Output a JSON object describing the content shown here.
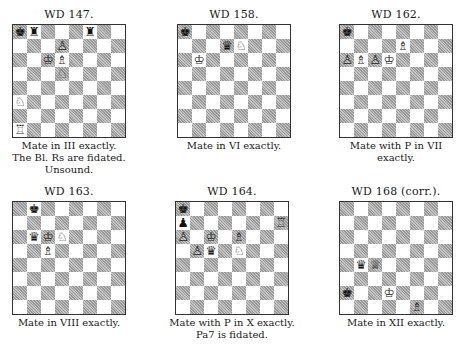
{
  "problems": [
    {
      "id": "wd147",
      "title": "WD 147.",
      "caption": [
        "Mate in III exactly.",
        "The Bl. Rs are fidated.",
        "Unsound."
      ],
      "pieces": [
        {
          "sq": "a8",
          "color": "black",
          "type": "king",
          "glyph": "♚"
        },
        {
          "sq": "b8",
          "color": "black",
          "type": "rook",
          "glyph": "♜"
        },
        {
          "sq": "f8",
          "color": "black",
          "type": "rook",
          "glyph": "♜"
        },
        {
          "sq": "d7",
          "color": "white",
          "type": "pawn",
          "glyph": "♙"
        },
        {
          "sq": "c6",
          "color": "white",
          "type": "king",
          "glyph": "♔"
        },
        {
          "sq": "d6",
          "color": "white",
          "type": "bishop",
          "glyph": "♗"
        },
        {
          "sq": "d5",
          "color": "white",
          "type": "knight",
          "glyph": "♘"
        },
        {
          "sq": "a3",
          "color": "white",
          "type": "knight",
          "glyph": "♘"
        },
        {
          "sq": "a1",
          "color": "white",
          "type": "rook",
          "glyph": "♖"
        }
      ]
    },
    {
      "id": "wd158",
      "title": "WD 158.",
      "caption": [
        "Mate in VI exactly."
      ],
      "pieces": [
        {
          "sq": "a8",
          "color": "black",
          "type": "king",
          "glyph": "♚"
        },
        {
          "sq": "d7",
          "color": "black",
          "type": "queen",
          "glyph": "♛"
        },
        {
          "sq": "e7",
          "color": "white",
          "type": "knight",
          "glyph": "♘"
        },
        {
          "sq": "b6",
          "color": "white",
          "type": "king",
          "glyph": "♔"
        }
      ]
    },
    {
      "id": "wd162",
      "title": "WD 162.",
      "caption": [
        "Mate with P in VII",
        "exactly."
      ],
      "pieces": [
        {
          "sq": "a8",
          "color": "black",
          "type": "king",
          "glyph": "♚"
        },
        {
          "sq": "e7",
          "color": "white",
          "type": "bishop",
          "glyph": "♗"
        },
        {
          "sq": "a6",
          "color": "white",
          "type": "pawn",
          "glyph": "♙"
        },
        {
          "sq": "b6",
          "color": "white",
          "type": "bishop",
          "glyph": "♗"
        },
        {
          "sq": "c6",
          "color": "white",
          "type": "pawn",
          "glyph": "♙"
        },
        {
          "sq": "d6",
          "color": "white",
          "type": "king",
          "glyph": "♔"
        }
      ]
    },
    {
      "id": "wd163",
      "title": "WD 163.",
      "caption": [
        "Mate in VIII exactly."
      ],
      "pieces": [
        {
          "sq": "b8",
          "color": "black",
          "type": "king",
          "glyph": "♚"
        },
        {
          "sq": "b6",
          "color": "black",
          "type": "queen",
          "glyph": "♛"
        },
        {
          "sq": "c6",
          "color": "white",
          "type": "king",
          "glyph": "♔"
        },
        {
          "sq": "d6",
          "color": "white",
          "type": "knight",
          "glyph": "♘"
        },
        {
          "sq": "c5",
          "color": "white",
          "type": "bishop",
          "glyph": "♗"
        }
      ]
    },
    {
      "id": "wd164",
      "title": "WD 164.",
      "caption": [
        "Mate with P in X exactly.",
        "Pa7 is fidated."
      ],
      "pieces": [
        {
          "sq": "a8",
          "color": "black",
          "type": "king",
          "glyph": "♚"
        },
        {
          "sq": "a7",
          "color": "black",
          "type": "pawn",
          "glyph": "♟"
        },
        {
          "sq": "h7",
          "color": "white",
          "type": "rook",
          "glyph": "♖"
        },
        {
          "sq": "a6",
          "color": "white",
          "type": "pawn",
          "glyph": "♙"
        },
        {
          "sq": "c6",
          "color": "white",
          "type": "king",
          "glyph": "♔"
        },
        {
          "sq": "e6",
          "color": "white",
          "type": "bishop",
          "glyph": "♗"
        },
        {
          "sq": "b5",
          "color": "white",
          "type": "pawn",
          "glyph": "♙"
        },
        {
          "sq": "c5",
          "color": "black",
          "type": "queen",
          "glyph": "♛"
        },
        {
          "sq": "e5",
          "color": "white",
          "type": "knight",
          "glyph": "♘"
        }
      ]
    },
    {
      "id": "wd168",
      "title": "WD 168 (corr.).",
      "caption": [
        "Mate in XII exactly."
      ],
      "pieces": [
        {
          "sq": "b4",
          "color": "black",
          "type": "queen",
          "glyph": "♛"
        },
        {
          "sq": "c4",
          "color": "white",
          "type": "queen",
          "glyph": "♕"
        },
        {
          "sq": "a2",
          "color": "black",
          "type": "king",
          "glyph": "♚"
        },
        {
          "sq": "d2",
          "color": "white",
          "type": "king",
          "glyph": "♔"
        },
        {
          "sq": "f1",
          "color": "white",
          "type": "bishop",
          "glyph": "♗"
        }
      ]
    }
  ]
}
